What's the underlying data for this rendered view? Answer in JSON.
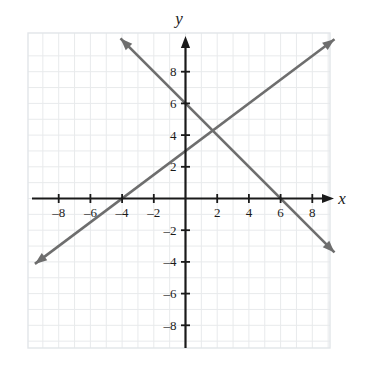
{
  "chart_data": {
    "type": "line",
    "title": "",
    "xlabel": "x",
    "ylabel": "y",
    "grid": true,
    "legend": "none",
    "xlim": [
      -9.5,
      9.5
    ],
    "ylim": [
      -9.5,
      9.5
    ],
    "x_ticks": [
      -8,
      -6,
      -4,
      -2,
      2,
      4,
      6,
      8
    ],
    "y_ticks": [
      -8,
      -6,
      -4,
      -2,
      2,
      4,
      6,
      8
    ],
    "x_tick_labels": [
      "–8",
      "–6",
      "–4",
      "–2",
      "2",
      "4",
      "6",
      "8"
    ],
    "y_tick_labels": [
      "–8",
      "–6",
      "–4",
      "–2",
      "2",
      "4",
      "6",
      "8"
    ],
    "series": [
      {
        "name": "ascending-line",
        "equation": "y = 0.75x + 3",
        "slope": 0.75,
        "intercept": 3,
        "x_intercept": -4,
        "y_intercept": 3,
        "color": "#6e6e6e",
        "arrows": "both",
        "endpoints": [
          [
            -9.5,
            -4.125
          ],
          [
            9.4,
            10.05
          ]
        ]
      },
      {
        "name": "descending-line",
        "equation": "y = -x + 6",
        "slope": -1,
        "intercept": 6,
        "x_intercept": 6,
        "y_intercept": 6,
        "color": "#6e6e6e",
        "arrows": "both",
        "endpoints": [
          [
            -4.1,
            10.1
          ],
          [
            9.4,
            -3.4
          ]
        ]
      }
    ],
    "intersection": [
      2,
      4
    ],
    "colors": {
      "axis": "#1a1a1a",
      "grid": "#e8eaec",
      "line": "#6e6e6e",
      "border": "#dfe2e5",
      "background": "#ffffff"
    }
  },
  "labels": {
    "x_axis": "x",
    "y_axis": "y"
  }
}
